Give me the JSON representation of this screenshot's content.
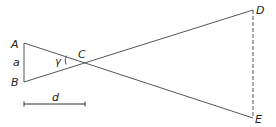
{
  "diagram": {
    "points": {
      "A": {
        "label": "A",
        "x": 24,
        "y": 43
      },
      "B": {
        "label": "B",
        "x": 24,
        "y": 82
      },
      "C": {
        "label": "C",
        "x": 80,
        "y": 60
      },
      "D": {
        "label": "D",
        "x": 253,
        "y": 10
      },
      "E": {
        "label": "E",
        "x": 253,
        "y": 118
      }
    },
    "labels": {
      "side_a": "a",
      "angle": "γ",
      "distance": "d"
    },
    "colors": {
      "line": "#555555",
      "text": "#222222"
    }
  }
}
